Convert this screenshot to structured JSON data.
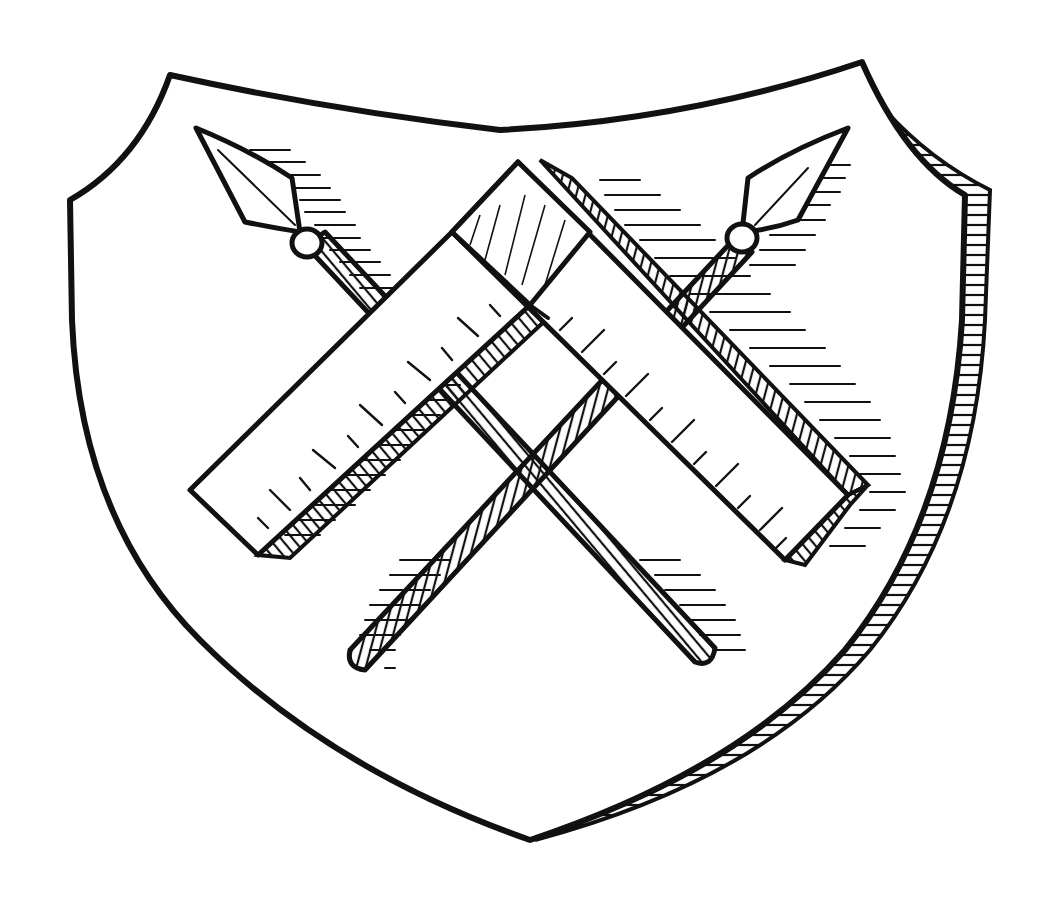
{
  "illustration": {
    "subject": "heraldic shield",
    "caption": "Shield with crossed spears and a carpenter's square",
    "colors": {
      "ink": "#111111",
      "paper": "#ffffff"
    },
    "elements": [
      {
        "name": "shield",
        "shape": "heater shield with concave top and shaded right bevel"
      },
      {
        "name": "spear-left",
        "orientation": "upper-left to lower-right",
        "hatched_shaft": true
      },
      {
        "name": "spear-right",
        "orientation": "upper-right to lower-left",
        "hatched_shaft": true
      },
      {
        "name": "carpenter-square",
        "orientation": "inverted V, apex at top",
        "ruler_tick_marks": true
      }
    ]
  }
}
